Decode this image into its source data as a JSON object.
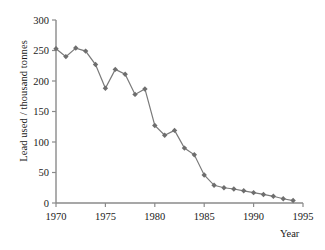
{
  "chart_data": {
    "type": "line",
    "title": "",
    "xlabel": "Year",
    "ylabel": "Lead used / thousand tonnes",
    "xlim": [
      1970,
      1995
    ],
    "ylim": [
      0,
      300
    ],
    "xticks": [
      1970,
      1975,
      1980,
      1985,
      1990,
      1995
    ],
    "yticks": [
      0,
      50,
      100,
      150,
      200,
      250,
      300
    ],
    "grid": false,
    "legend": null,
    "marker": "diamond",
    "line_color": "#7a7a7a",
    "marker_color": "#6e6e6e",
    "x": [
      1970,
      1971,
      1972,
      1973,
      1974,
      1975,
      1976,
      1977,
      1978,
      1979,
      1980,
      1981,
      1982,
      1983,
      1984,
      1985,
      1986,
      1987,
      1988,
      1989,
      1990,
      1991,
      1992,
      1993,
      1994
    ],
    "values": [
      253,
      240,
      254,
      249,
      227,
      188,
      219,
      211,
      178,
      187,
      127,
      111,
      119,
      90,
      79,
      46,
      29,
      25,
      23,
      20,
      17,
      14,
      11,
      7,
      4
    ],
    "series": [
      {
        "name": "Lead used",
        "values": [
          253,
          240,
          254,
          249,
          227,
          188,
          219,
          211,
          178,
          187,
          127,
          111,
          119,
          90,
          79,
          46,
          29,
          25,
          23,
          20,
          17,
          14,
          11,
          7,
          4
        ]
      }
    ]
  },
  "axes": {
    "y_tick_labels": [
      "0",
      "50",
      "100",
      "150",
      "200",
      "250",
      "300"
    ],
    "x_tick_labels": [
      "1970",
      "1975",
      "1980",
      "1985",
      "1990",
      "1995"
    ]
  }
}
